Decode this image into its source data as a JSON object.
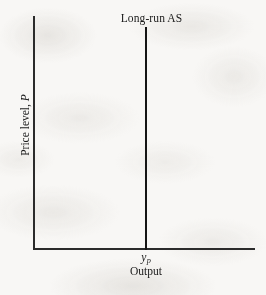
{
  "figure": {
    "kind": "long-run-aggregate-supply-diagram",
    "background_color": "#f8f7f5",
    "ink_color": "#2b2b2b",
    "curve_color": "#151515"
  },
  "axes": {
    "y_axis": {
      "title_prefix": "Price level, ",
      "title_variable": "P",
      "full_title": "Price level, P",
      "orientation": "vertical",
      "rotation_deg": -90,
      "ticks": [],
      "gridlines": false
    },
    "x_axis": {
      "title": "Output",
      "orientation": "horizontal",
      "ticks": [],
      "gridlines": false
    }
  },
  "curves": [
    {
      "label": "Long-run AS",
      "name": "long-run-aggregate-supply",
      "shape": "vertical-line",
      "color": "#151515"
    }
  ],
  "annotations": {
    "potential_output": {
      "variable": "y",
      "subscript": "p",
      "full": "yp",
      "position": "x-axis at long-run AS intersection"
    }
  },
  "chart_data": {
    "type": "line",
    "title": "",
    "xlabel": "Output",
    "ylabel": "Price level, P",
    "xlim": [
      0,
      1
    ],
    "ylim": [
      0,
      1
    ],
    "grid": false,
    "legend": "none",
    "series": [
      {
        "name": "Long-run AS",
        "x": [
          0.506,
          0.506
        ],
        "y": [
          0.0,
          1.0
        ],
        "color": "#151515",
        "annotation": "Long-run AS"
      }
    ],
    "x_tick_labels": [
      "yp"
    ],
    "x_tick_positions": [
      0.506
    ],
    "y_tick_labels": [],
    "y_tick_positions": []
  }
}
